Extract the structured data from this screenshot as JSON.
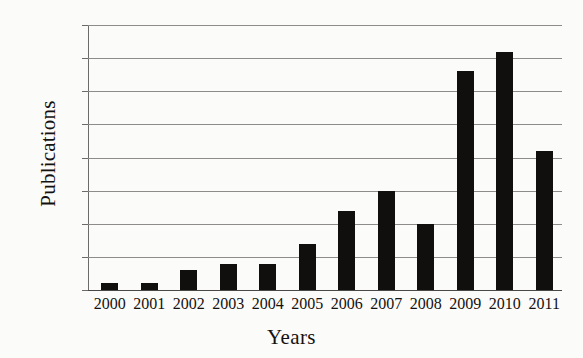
{
  "chart_data": {
    "type": "bar",
    "title": "",
    "xlabel": "Years",
    "ylabel": "Publications",
    "categories": [
      "2000",
      "2001",
      "2002",
      "2003",
      "2004",
      "2005",
      "2006",
      "2007",
      "2008",
      "2009",
      "2010",
      "2011"
    ],
    "values": [
      1,
      1,
      3,
      4,
      4,
      7,
      12,
      15,
      10,
      33,
      36,
      21
    ],
    "yticks": [
      0,
      5,
      10,
      15,
      20,
      25,
      30,
      35,
      40
    ],
    "ylim": [
      0,
      40
    ],
    "grid": "horizontal",
    "legend": "none",
    "series_name": "Publications",
    "bar_color": "#100f0e",
    "grid_color": "#8e8c8a",
    "background_color": "#fbfbfa",
    "text_color": "#15110f"
  }
}
